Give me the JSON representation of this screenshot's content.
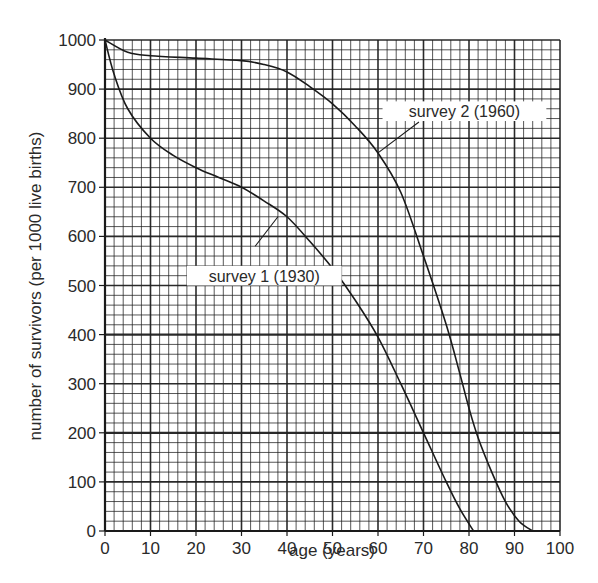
{
  "chart_data": {
    "type": "line",
    "title": "",
    "xlabel": "age (years)",
    "ylabel": "number of survivors (per 1000 live births)",
    "xlim": [
      0,
      100
    ],
    "ylim": [
      0,
      1000
    ],
    "x_ticks": [
      0,
      10,
      20,
      30,
      40,
      50,
      60,
      70,
      80,
      90,
      100
    ],
    "y_ticks": [
      0,
      100,
      200,
      300,
      400,
      500,
      600,
      700,
      800,
      900,
      1000
    ],
    "grid": true,
    "grid_minor_step_x": 2,
    "grid_minor_step_y": 20,
    "legend": "none (inline annotations)",
    "series": [
      {
        "name": "survey 1 (1930)",
        "x": [
          0,
          2,
          5,
          10,
          15,
          20,
          25,
          30,
          35,
          40,
          45,
          50,
          55,
          60,
          65,
          70,
          75,
          78,
          81
        ],
        "y": [
          1000,
          930,
          860,
          800,
          765,
          740,
          720,
          700,
          672,
          640,
          590,
          535,
          470,
          395,
          300,
          200,
          100,
          45,
          0
        ]
      },
      {
        "name": "survey 2 (1960)",
        "x": [
          0,
          5,
          10,
          20,
          30,
          35,
          40,
          45,
          50,
          55,
          60,
          65,
          70,
          75,
          78,
          80,
          82,
          85,
          88,
          91,
          94
        ],
        "y": [
          1000,
          975,
          968,
          963,
          958,
          950,
          935,
          905,
          870,
          825,
          770,
          690,
          560,
          420,
          320,
          250,
          190,
          120,
          60,
          20,
          0
        ]
      }
    ],
    "annotations": [
      {
        "text": "survey 1 (1930)",
        "box_x": 18,
        "box_y": 540,
        "box_w": 34,
        "box_h": 40,
        "pointer_to": [
          38,
          640
        ],
        "pointer_from": [
          33,
          580
        ]
      },
      {
        "text": "survey 2 (1960)",
        "box_x": 61,
        "box_y": 875,
        "box_w": 36,
        "box_h": 40,
        "pointer_to": [
          60,
          770
        ],
        "pointer_from": [
          69,
          833
        ]
      }
    ]
  },
  "colors": {
    "line": "#1a1a1a",
    "grid": "#1f1f1f",
    "background": "#ffffff",
    "text": "#2a2a2a"
  }
}
